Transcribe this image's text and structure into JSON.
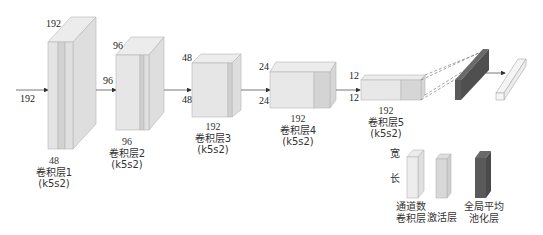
{
  "input": {
    "size_label": "192"
  },
  "layers": [
    {
      "name": "卷积层1",
      "kernel": "(k5s2)",
      "channels": "48",
      "height_label": "192",
      "width_label": ""
    },
    {
      "name": "卷积层2",
      "kernel": "(k5s2)",
      "channels": "96",
      "height_label": "96",
      "width_label": "96"
    },
    {
      "name": "卷积层3",
      "kernel": "(k5s2)",
      "channels": "192",
      "height_label": "48",
      "width_label": "48"
    },
    {
      "name": "卷积层4",
      "kernel": "(k5s2)",
      "channels": "192",
      "height_label": "24",
      "width_label": "24"
    },
    {
      "name": "卷积层5",
      "kernel": "(k5s2)",
      "channels": "192",
      "height_label": "12",
      "width_label": "12"
    }
  ],
  "legend": {
    "width_label": "宽",
    "length_label": "长",
    "items": [
      {
        "line1": "通道数",
        "line2": "卷积层"
      },
      {
        "line1": "",
        "line2": "激活层"
      },
      {
        "line1": "全局平均",
        "line2": "池化层"
      }
    ]
  },
  "colors": {
    "conv_front": "#e4e4e4",
    "conv_side": "#d9d9d9",
    "conv_top": "#ececec",
    "activation": "#cfcfcf",
    "gap_pool": "#5a5a5a",
    "output": "#f4f4f4",
    "edge": "#b5b5b5"
  }
}
